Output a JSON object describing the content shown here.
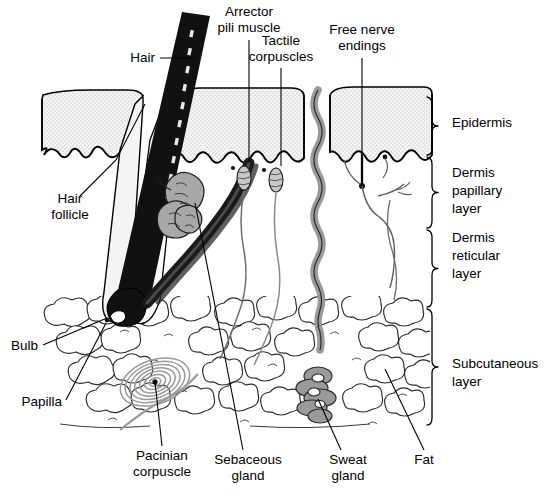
{
  "figure": {
    "background_color": "#ffffff",
    "ink_color": "#000000",
    "width": 547,
    "height": 498
  },
  "palette": {
    "epidermis_stipple": "#cfcfcf",
    "gland_gray": "#9a9a9a",
    "nerve_gray": "#9e9e9e",
    "pacinian_gray": "#8f8f8f",
    "hair_black": "#111111",
    "fat_outline": "#333333"
  },
  "callouts": [
    {
      "id": "hair",
      "label": "Hair",
      "lines": [
        "Hair"
      ],
      "text_x": 155,
      "text_y": 62,
      "anchor": "end",
      "leader": "M 160 58 L 196 58"
    },
    {
      "id": "arrector-pili-muscle",
      "label": "Arrector pili muscle",
      "lines": [
        "Arrector",
        "pili muscle"
      ],
      "text_x": 249,
      "text_y": 16,
      "anchor": "mid",
      "leader": "M 249 40 L 249 163"
    },
    {
      "id": "tactile-corpuscles",
      "label": "Tactile corpuscles",
      "lines": [
        "Tactile",
        "corpuscles"
      ],
      "text_x": 281,
      "text_y": 45,
      "anchor": "mid",
      "leader": "M 281 68 L 281 166"
    },
    {
      "id": "free-nerve-endings",
      "label": "Free nerve endings",
      "lines": [
        "Free nerve",
        "endings"
      ],
      "text_x": 362,
      "text_y": 34,
      "anchor": "mid",
      "leader": "M 362 58 L 362 185"
    },
    {
      "id": "hair-follicle",
      "label": "Hair follicle",
      "lines": [
        "Hair",
        "follicle"
      ],
      "text_x": 70,
      "text_y": 203,
      "anchor": "mid",
      "leader": "M 80 196 L 116 160 L 145 104"
    },
    {
      "id": "bulb",
      "label": "Bulb",
      "lines": [
        "Bulb"
      ],
      "text_x": 38,
      "text_y": 350,
      "anchor": "end",
      "leader": "M 43 345 L 107 318"
    },
    {
      "id": "papilla",
      "label": "Papilla",
      "lines": [
        "Papilla"
      ],
      "text_x": 62,
      "text_y": 406,
      "anchor": "end",
      "leader": "M 66 400 L 106 323"
    },
    {
      "id": "pacinian-corpuscle",
      "label": "Pacinian corpuscle",
      "lines": [
        "Pacinian",
        "corpuscle"
      ],
      "text_x": 162,
      "text_y": 460,
      "anchor": "mid",
      "leader": "M 162 446 L 155 382"
    },
    {
      "id": "sebaceous-gland",
      "label": "Sebaceous gland",
      "lines": [
        "Sebaceous",
        "gland"
      ],
      "text_x": 248,
      "text_y": 464,
      "anchor": "mid",
      "leader": "M 243 450 L 195 203"
    },
    {
      "id": "sweat-gland",
      "label": "Sweat gland",
      "lines": [
        "Sweat",
        "gland"
      ],
      "text_x": 348,
      "text_y": 464,
      "anchor": "mid",
      "leader": "M 341 450 L 318 399"
    },
    {
      "id": "fat",
      "label": "Fat",
      "lines": [
        "Fat"
      ],
      "text_x": 424,
      "text_y": 464,
      "anchor": "mid",
      "leader": "M 424 450 L 385 369"
    }
  ],
  "layers": [
    {
      "id": "epidermis",
      "label": "Epidermis",
      "lines": [
        "Epidermis"
      ],
      "text_x": 452,
      "text_y": 127,
      "bracket_top": 97,
      "bracket_bottom": 155,
      "bracket_x": 432
    },
    {
      "id": "dermis-papillary-layer",
      "label": "Dermis papillary layer",
      "lines": [
        "Dermis",
        "papillary",
        "layer"
      ],
      "text_x": 452,
      "text_y": 177,
      "bracket_top": 157,
      "bracket_bottom": 228,
      "bracket_x": 432
    },
    {
      "id": "dermis-reticular-layer",
      "label": "Dermis reticular layer",
      "lines": [
        "Dermis",
        "reticular",
        "layer"
      ],
      "text_x": 452,
      "text_y": 242,
      "bracket_top": 230,
      "bracket_bottom": 307,
      "bracket_x": 432
    },
    {
      "id": "subcutaneous-layer",
      "label": "Subcutaneous layer",
      "lines": [
        "Subcutaneous",
        "layer"
      ],
      "text_x": 452,
      "text_y": 368,
      "bracket_top": 309,
      "bracket_bottom": 425,
      "bracket_x": 432
    }
  ]
}
